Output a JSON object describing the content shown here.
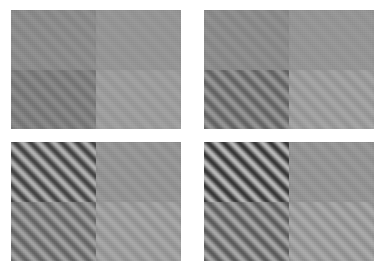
{
  "figure": {
    "type": "stimulus-grid",
    "background_color": "#ffffff",
    "canvas": {
      "width": 387,
      "height": 271
    },
    "panel_layout": {
      "rows": 2,
      "columns": 2
    },
    "quadrant_layout": {
      "rows": 2,
      "columns": 2
    },
    "grating": {
      "orientation_label": "oblique",
      "orientation_degrees": 45,
      "period_px": 11
    }
  },
  "panels": [
    {
      "id": "panel-top-left",
      "position": {
        "x": 11,
        "y": 10,
        "width": 170,
        "height": 119
      },
      "quadrants": [
        {
          "id": "q-tl",
          "mean_color": "#8b8b8b",
          "grating_contrast": 0.02
        },
        {
          "id": "q-tr",
          "mean_color": "#959595",
          "grating_contrast": 0.01
        },
        {
          "id": "q-bl",
          "mean_color": "#7f7f7f",
          "grating_contrast": 0.04
        },
        {
          "id": "q-br",
          "mean_color": "#9c9c9c",
          "grating_contrast": 0.02
        }
      ]
    },
    {
      "id": "panel-top-right",
      "position": {
        "x": 204,
        "y": 10,
        "width": 170,
        "height": 119
      },
      "quadrants": [
        {
          "id": "q-tl",
          "mean_color": "#8b8b8b",
          "grating_contrast": 0.02
        },
        {
          "id": "q-tr",
          "mean_color": "#959595",
          "grating_contrast": 0.01
        },
        {
          "id": "q-bl",
          "mean_color": "#7c7c7c",
          "grating_contrast": 0.1
        },
        {
          "id": "q-br",
          "mean_color": "#9d9d9d",
          "grating_contrast": 0.03
        }
      ]
    },
    {
      "id": "panel-bottom-left",
      "position": {
        "x": 11,
        "y": 142,
        "width": 170,
        "height": 119
      },
      "quadrants": [
        {
          "id": "q-tl",
          "mean_color": "#7a7a7a",
          "grating_contrast": 0.22
        },
        {
          "id": "q-tr",
          "mean_color": "#949494",
          "grating_contrast": 0.02
        },
        {
          "id": "q-bl",
          "mean_color": "#838383",
          "grating_contrast": 0.12
        },
        {
          "id": "q-br",
          "mean_color": "#9d9d9d",
          "grating_contrast": 0.04
        }
      ]
    },
    {
      "id": "panel-bottom-right",
      "position": {
        "x": 204,
        "y": 142,
        "width": 170,
        "height": 119
      },
      "quadrants": [
        {
          "id": "q-tl",
          "mean_color": "#777777",
          "grating_contrast": 0.26
        },
        {
          "id": "q-tr",
          "mean_color": "#949494",
          "grating_contrast": 0.02
        },
        {
          "id": "q-bl",
          "mean_color": "#818181",
          "grating_contrast": 0.15
        },
        {
          "id": "q-br",
          "mean_color": "#9d9d9d",
          "grating_contrast": 0.05
        }
      ]
    }
  ]
}
